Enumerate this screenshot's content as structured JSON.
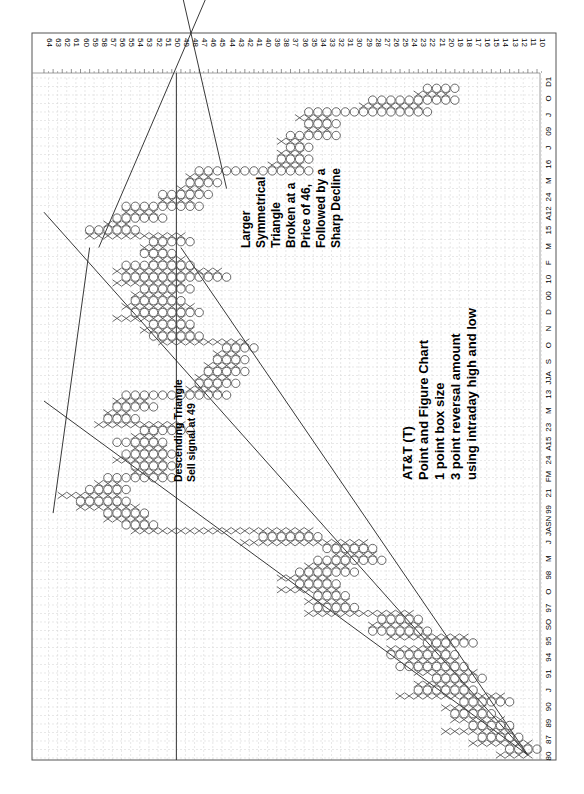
{
  "chart_data": {
    "type": "point_and_figure",
    "title": "AT&T (T)",
    "subtitle_lines": [
      "Point and Figure Chart",
      "1 point box size",
      "3 point reversal amount",
      "using intraday  high and low"
    ],
    "orientation": "rotated 90 degrees clockwise: price axis along top, time axis along right edge",
    "price_axis": {
      "min": 10,
      "max": 64,
      "step": 1,
      "ticks": [
        64,
        63,
        62,
        61,
        60,
        59,
        58,
        57,
        56,
        55,
        54,
        53,
        52,
        51,
        50,
        49,
        48,
        47,
        46,
        45,
        44,
        43,
        42,
        41,
        40,
        39,
        38,
        37,
        36,
        35,
        34,
        33,
        32,
        31,
        30,
        29,
        28,
        27,
        26,
        25,
        24,
        23,
        22,
        21,
        20,
        19,
        18,
        17,
        16,
        15,
        14,
        13,
        12,
        11,
        10
      ]
    },
    "time_axis_labels": [
      "80",
      "87",
      "89",
      "90",
      "J",
      "91",
      "94",
      "95",
      "SO",
      "97",
      "O",
      "98",
      "M",
      "J",
      "JASN",
      "99",
      "21",
      "FM",
      "24",
      "A15",
      "23",
      "M",
      "13",
      "JJA",
      "S",
      "O",
      "N",
      "D",
      "00",
      "10",
      "F",
      "M",
      "15",
      "A12",
      "24",
      "M",
      "16",
      "J",
      "09",
      "J",
      "O",
      "D1"
    ],
    "box_size": 1,
    "reversal": 3,
    "annotations": [
      {
        "lines": [
          "Descending Triangle",
          "Sell signal at 49"
        ]
      },
      {
        "lines": [
          "Larger",
          "Symmetrical",
          "Triangle",
          "Broken at a",
          "Price of 46,",
          "Followed by a",
          "Sharp Decline"
        ]
      }
    ],
    "reference_level": 49.5,
    "columns": [
      {
        "t": "X",
        "lo": 11,
        "hi": 14
      },
      {
        "t": "O",
        "lo": 10,
        "hi": 13
      },
      {
        "t": "X",
        "lo": 11,
        "hi": 17
      },
      {
        "t": "O",
        "lo": 12,
        "hi": 16
      },
      {
        "t": "X",
        "lo": 13,
        "hi": 20
      },
      {
        "t": "O",
        "lo": 13,
        "hi": 17
      },
      {
        "t": "X",
        "lo": 14,
        "hi": 19
      },
      {
        "t": "O",
        "lo": 15,
        "hi": 19
      },
      {
        "t": "X",
        "lo": 16,
        "hi": 20
      },
      {
        "t": "O",
        "lo": 13,
        "hi": 18
      },
      {
        "t": "X",
        "lo": 14,
        "hi": 25
      },
      {
        "t": "O",
        "lo": 17,
        "hi": 23
      },
      {
        "t": "X",
        "lo": 18,
        "hi": 23
      },
      {
        "t": "O",
        "lo": 16,
        "hi": 21
      },
      {
        "t": "X",
        "lo": 17,
        "hi": 23
      },
      {
        "t": "O",
        "lo": 18,
        "hi": 25
      },
      {
        "t": "X",
        "lo": 19,
        "hi": 24
      },
      {
        "t": "O",
        "lo": 19,
        "hi": 26
      },
      {
        "t": "X",
        "lo": 20,
        "hi": 26
      },
      {
        "t": "O",
        "lo": 17,
        "hi": 22
      },
      {
        "t": "X",
        "lo": 18,
        "hi": 26
      },
      {
        "t": "O",
        "lo": 22,
        "hi": 28
      },
      {
        "t": "X",
        "lo": 23,
        "hi": 28
      },
      {
        "t": "O",
        "lo": 23,
        "hi": 27
      },
      {
        "t": "X",
        "lo": 24,
        "hi": 35
      },
      {
        "t": "O",
        "lo": 30,
        "hi": 34
      },
      {
        "t": "X",
        "lo": 31,
        "hi": 35
      },
      {
        "t": "O",
        "lo": 31,
        "hi": 34
      },
      {
        "t": "X",
        "lo": 32,
        "hi": 38
      },
      {
        "t": "O",
        "lo": 32,
        "hi": 36
      },
      {
        "t": "X",
        "lo": 33,
        "hi": 38
      },
      {
        "t": "O",
        "lo": 30,
        "hi": 36
      },
      {
        "t": "X",
        "lo": 31,
        "hi": 35
      },
      {
        "t": "O",
        "lo": 27,
        "hi": 34
      },
      {
        "t": "X",
        "lo": 28,
        "hi": 32
      },
      {
        "t": "O",
        "lo": 28,
        "hi": 33
      },
      {
        "t": "X",
        "lo": 29,
        "hi": 42
      },
      {
        "t": "O",
        "lo": 34,
        "hi": 40
      },
      {
        "t": "X",
        "lo": 35,
        "hi": 54
      },
      {
        "t": "O",
        "lo": 52,
        "hi": 55
      },
      {
        "t": "X",
        "lo": 53,
        "hi": 57
      },
      {
        "t": "O",
        "lo": 53,
        "hi": 57
      },
      {
        "t": "X",
        "lo": 54,
        "hi": 60
      },
      {
        "t": "O",
        "lo": 55,
        "hi": 60
      },
      {
        "t": "X",
        "lo": 56,
        "hi": 62
      },
      {
        "t": "O",
        "lo": 55,
        "hi": 59
      },
      {
        "t": "X",
        "lo": 56,
        "hi": 58
      },
      {
        "t": "O",
        "lo": 50,
        "hi": 57
      },
      {
        "t": "X",
        "lo": 51,
        "hi": 54
      },
      {
        "t": "O",
        "lo": 50,
        "hi": 54
      },
      {
        "t": "X",
        "lo": 51,
        "hi": 56
      },
      {
        "t": "O",
        "lo": 50,
        "hi": 55
      },
      {
        "t": "X",
        "lo": 51,
        "hi": 54
      },
      {
        "t": "O",
        "lo": 51,
        "hi": 56
      },
      {
        "t": "X",
        "lo": 52,
        "hi": 54
      },
      {
        "t": "O",
        "lo": 48,
        "hi": 53
      },
      {
        "t": "X",
        "lo": 49,
        "hi": 58
      },
      {
        "t": "O",
        "lo": 54,
        "hi": 57
      },
      {
        "t": "X",
        "lo": 55,
        "hi": 57
      },
      {
        "t": "O",
        "lo": 52,
        "hi": 56
      },
      {
        "t": "X",
        "lo": 53,
        "hi": 56
      },
      {
        "t": "O",
        "lo": 44,
        "hi": 55
      },
      {
        "t": "X",
        "lo": 45,
        "hi": 48
      },
      {
        "t": "O",
        "lo": 43,
        "hi": 47
      },
      {
        "t": "X",
        "lo": 44,
        "hi": 47
      },
      {
        "t": "O",
        "lo": 42,
        "hi": 46
      },
      {
        "t": "X",
        "lo": 43,
        "hi": 46
      },
      {
        "t": "O",
        "lo": 42,
        "hi": 45
      },
      {
        "t": "X",
        "lo": 43,
        "hi": 45
      },
      {
        "t": "O",
        "lo": 41,
        "hi": 44
      },
      {
        "t": "X",
        "lo": 42,
        "hi": 51
      },
      {
        "t": "O",
        "lo": 47,
        "hi": 52
      },
      {
        "t": "X",
        "lo": 48,
        "hi": 53
      },
      {
        "t": "O",
        "lo": 48,
        "hi": 52
      },
      {
        "t": "X",
        "lo": 49,
        "hi": 56
      },
      {
        "t": "O",
        "lo": 47,
        "hi": 54
      },
      {
        "t": "X",
        "lo": 48,
        "hi": 55
      },
      {
        "t": "O",
        "lo": 49,
        "hi": 54
      },
      {
        "t": "X",
        "lo": 50,
        "hi": 54
      },
      {
        "t": "O",
        "lo": 48,
        "hi": 53
      },
      {
        "t": "X",
        "lo": 49,
        "hi": 56
      },
      {
        "t": "O",
        "lo": 44,
        "hi": 55
      },
      {
        "t": "X",
        "lo": 45,
        "hi": 56
      },
      {
        "t": "O",
        "lo": 48,
        "hi": 55
      },
      {
        "t": "X",
        "lo": 49,
        "hi": 52
      },
      {
        "t": "O",
        "lo": 50,
        "hi": 53
      },
      {
        "t": "X",
        "lo": 51,
        "hi": 53
      },
      {
        "t": "O",
        "lo": 48,
        "hi": 52
      },
      {
        "t": "X",
        "lo": 49,
        "hi": 59
      },
      {
        "t": "O",
        "lo": 54,
        "hi": 59
      },
      {
        "t": "X",
        "lo": 55,
        "hi": 57
      },
      {
        "t": "O",
        "lo": 51,
        "hi": 56
      },
      {
        "t": "X",
        "lo": 52,
        "hi": 55
      },
      {
        "t": "O",
        "lo": 47,
        "hi": 55
      },
      {
        "t": "X",
        "lo": 48,
        "hi": 51
      },
      {
        "t": "O",
        "lo": 46,
        "hi": 51
      },
      {
        "t": "X",
        "lo": 47,
        "hi": 49
      },
      {
        "t": "O",
        "lo": 45,
        "hi": 48
      },
      {
        "t": "X",
        "lo": 46,
        "hi": 48
      },
      {
        "t": "O",
        "lo": 35,
        "hi": 47
      },
      {
        "t": "X",
        "lo": 36,
        "hi": 39
      },
      {
        "t": "O",
        "lo": 35,
        "hi": 38
      },
      {
        "t": "X",
        "lo": 36,
        "hi": 38
      },
      {
        "t": "O",
        "lo": 35,
        "hi": 37
      },
      {
        "t": "X",
        "lo": 36,
        "hi": 38
      },
      {
        "t": "O",
        "lo": 32,
        "hi": 37
      },
      {
        "t": "X",
        "lo": 33,
        "hi": 35
      },
      {
        "t": "O",
        "lo": 32,
        "hi": 35
      },
      {
        "t": "X",
        "lo": 33,
        "hi": 36
      },
      {
        "t": "O",
        "lo": 22,
        "hi": 35
      },
      {
        "t": "X",
        "lo": 23,
        "hi": 29
      },
      {
        "t": "O",
        "lo": 19,
        "hi": 28
      },
      {
        "t": "X",
        "lo": 20,
        "hi": 23
      },
      {
        "t": "O",
        "lo": 19,
        "hi": 22
      }
    ],
    "trendlines": [
      {
        "name": "long-term uptrend 1",
        "from": [
          11,
          0
        ],
        "to": [
          64,
          92
        ]
      },
      {
        "name": "long-term uptrend 2",
        "from": [
          11,
          0
        ],
        "to": [
          64,
          60
        ]
      },
      {
        "name": "long-term uptrend 3",
        "from": [
          11,
          0
        ],
        "to": [
          49,
          86
        ]
      },
      {
        "name": "descending triangle upper",
        "from": [
          63,
          41
        ],
        "to": [
          59,
          86
        ]
      },
      {
        "name": "symmetrical triangle upper",
        "from": [
          58,
          86
        ],
        "to": [
          43,
          140
        ]
      },
      {
        "name": "symmetrical triangle lower",
        "from": [
          44,
          96
        ],
        "to": [
          52,
          150
        ]
      }
    ]
  },
  "page": {
    "header_note": ""
  }
}
